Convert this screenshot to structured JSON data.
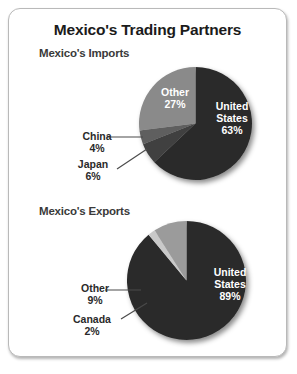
{
  "title": "Mexico's Trading Partners",
  "panels": [
    {
      "subtitle": "Mexico's Imports"
    },
    {
      "subtitle": "Mexico's Exports"
    }
  ],
  "colors": {
    "united_states": "#2b2b2b",
    "other_imports": "#8a8a8a",
    "china": "#5e5e5e",
    "japan": "#3f3f3f",
    "other_exports": "#9b9b9b",
    "canada": "#c9c9c9",
    "frame_border": "#b9b9b9",
    "title_text": "#1b1b1b",
    "subtitle_text": "#3a3a3a",
    "label_light": "#ffffff",
    "label_dark": "#2a2a2a"
  },
  "labels": {
    "imports": {
      "us_name": "United",
      "us_name2": "States",
      "us_pct": "63%",
      "other_name": "Other",
      "other_pct": "27%",
      "china_name": "China",
      "china_pct": "4%",
      "japan_name": "Japan",
      "japan_pct": "6%"
    },
    "exports": {
      "us_name": "United",
      "us_name2": "States",
      "us_pct": "89%",
      "other_name": "Other",
      "other_pct": "9%",
      "canada_name": "Canada",
      "canada_pct": "2%"
    }
  },
  "chart_data": [
    {
      "type": "pie",
      "title": "Mexico's Imports",
      "categories": [
        "United States",
        "Other",
        "China",
        "Japan"
      ],
      "values": [
        63,
        27,
        4,
        6
      ],
      "value_labels": [
        "63%",
        "27%",
        "4%",
        "6%"
      ],
      "colors": [
        "#2b2b2b",
        "#8a8a8a",
        "#5e5e5e",
        "#3f3f3f"
      ],
      "units": "percent",
      "legend": "none",
      "labels_inside": [
        "United States",
        "Other"
      ],
      "labels_outside": [
        "China",
        "Japan"
      ],
      "start_angle_deg": 0,
      "direction": "clockwise"
    },
    {
      "type": "pie",
      "title": "Mexico's Exports",
      "categories": [
        "United States",
        "Other",
        "Canada"
      ],
      "values": [
        89,
        9,
        2
      ],
      "value_labels": [
        "89%",
        "9%",
        "2%"
      ],
      "colors": [
        "#2b2b2b",
        "#9b9b9b",
        "#c9c9c9"
      ],
      "units": "percent",
      "legend": "none",
      "labels_inside": [
        "United States"
      ],
      "labels_outside": [
        "Other",
        "Canada"
      ],
      "start_angle_deg": 0,
      "direction": "clockwise"
    }
  ]
}
